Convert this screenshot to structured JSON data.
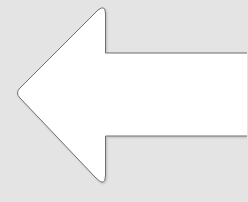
{
  "icon": {
    "name": "left-arrow",
    "fill": "#ffffff",
    "stroke": "#6e6e6e",
    "background": "#e4e4e4"
  }
}
